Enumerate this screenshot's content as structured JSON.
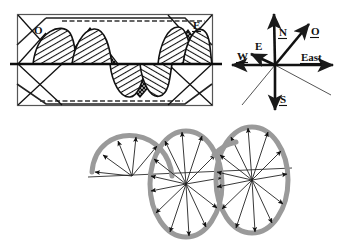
{
  "figure": {
    "background_color": "#ffffff",
    "ink_color": "#111111",
    "gray_color": "#9a9a9a"
  },
  "wave_panel": {
    "name": "boxed-wave-panel",
    "frame": {
      "x": 17,
      "y": 14,
      "width": 196,
      "height": 92
    },
    "axis_y": 64,
    "labels": [
      {
        "id": "origin",
        "text": "O",
        "x": 34,
        "y": 33,
        "underline": false
      },
      {
        "id": "end",
        "text": "E",
        "x": 196,
        "y": 28,
        "underline": true
      }
    ],
    "hatch_patterns": [
      "diagonal-hatch",
      "cross-dot-hatch"
    ],
    "lobes": [
      {
        "id": "lobe-1",
        "polarity": "positive",
        "x_start": 30,
        "x_end": 78
      },
      {
        "id": "lobe-2",
        "polarity": "positive",
        "x_start": 68,
        "x_end": 110
      },
      {
        "id": "lobe-3",
        "polarity": "negative",
        "x_start": 108,
        "x_end": 150
      },
      {
        "id": "lobe-4",
        "polarity": "negative",
        "x_start": 140,
        "x_end": 178
      },
      {
        "id": "lobe-5",
        "polarity": "positive",
        "x_start": 160,
        "x_end": 200
      }
    ]
  },
  "compass_panel": {
    "name": "compass-rose",
    "center": {
      "x": 275,
      "y": 65
    },
    "arrows": [
      {
        "id": "north",
        "label": "N",
        "label_underline": true,
        "tip_x": 274,
        "tip_y": 10,
        "label_x": 281,
        "label_y": 33,
        "weight": "heavy",
        "head": true
      },
      {
        "id": "south",
        "label": "S",
        "label_underline": true,
        "tip_x": 275,
        "tip_y": 114,
        "label_x": 281,
        "label_y": 101,
        "weight": "heavy",
        "head": true
      },
      {
        "id": "west",
        "label": "W",
        "label_underline": true,
        "tip_x": 228,
        "tip_y": 65,
        "label_x": 240,
        "label_y": 58,
        "weight": "heavy",
        "head": true
      },
      {
        "id": "east",
        "label": "East",
        "label_underline": true,
        "tip_x": 337,
        "tip_y": 65,
        "label_x": 303,
        "label_y": 59,
        "weight": "heavy",
        "head": true
      },
      {
        "id": "o-axis",
        "label": "O",
        "label_underline": true,
        "tip_x": 311,
        "tip_y": 21,
        "label_x": 314,
        "label_y": 33,
        "weight": "heavy",
        "head": true
      },
      {
        "id": "e-axis",
        "label": "E",
        "label_underline": false,
        "tip_x": 248,
        "tip_y": 52,
        "label_x": 259,
        "label_y": 49,
        "weight": "heavy",
        "head": true
      }
    ],
    "thin_lines": [
      {
        "id": "thin-sw",
        "x1": 275,
        "y1": 65,
        "x2": 242,
        "y2": 104
      },
      {
        "id": "thin-se",
        "x1": 275,
        "y1": 65,
        "x2": 330,
        "y2": 94
      }
    ]
  },
  "helix_panel": {
    "name": "helix-field-vectors",
    "axis": {
      "x1": 88,
      "y1": 176,
      "x2": 290,
      "y2": 168
    },
    "loop_stroke_color": "#9a9a9a",
    "loop_stroke_width": 4,
    "vector_color": "#222222",
    "loops": [
      {
        "id": "loop-partial",
        "cx": 132,
        "cy": 176,
        "rx": 42,
        "ry": 34,
        "vector_count": 5,
        "partial": true,
        "arc_start_deg": 180,
        "arc_end_deg": 360
      },
      {
        "id": "loop-1",
        "cx": 186,
        "cy": 184,
        "rx": 36,
        "ry": 53,
        "vector_count": 13,
        "partial": false
      },
      {
        "id": "loop-2",
        "cx": 252,
        "cy": 180,
        "rx": 36,
        "ry": 53,
        "vector_count": 13,
        "partial": false
      }
    ]
  }
}
